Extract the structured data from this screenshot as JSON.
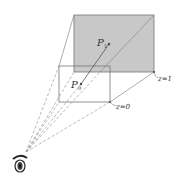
{
  "diagram": {
    "type": "perspective-projection",
    "colors": {
      "far_plane_fill": "#c8c8c8",
      "stroke": "#777777",
      "dashed": "#9a9a9a",
      "text": "#333333"
    },
    "labels": {
      "p1": "P",
      "p1_sub": "1",
      "p0": "P",
      "p0_sub": "0",
      "z1": "z=1",
      "z0": "z=0"
    },
    "elements": [
      "far-plane (shaded rectangle, z=1)",
      "near-plane (outlined rectangle, z=0)",
      "line segment P0 to P1",
      "eye/viewpoint",
      "dashed projection rays from eye"
    ]
  }
}
